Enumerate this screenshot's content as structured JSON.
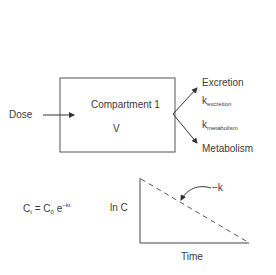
{
  "compartment": {
    "title": "Compartment 1",
    "volume": "V"
  },
  "input": {
    "label": "Dose"
  },
  "outputs": {
    "top": "Excretion",
    "bottom": "Metabolism",
    "k1_base": "k",
    "k1_sub": "excretion",
    "k2_base": "k",
    "k2_sub": "metabolism"
  },
  "equation": {
    "lhs_base": "C",
    "lhs_sub": "t",
    "equals": "=",
    "c0_base": "C",
    "c0_sub": "0",
    "exp_base": "e",
    "exp_sup": "−kt"
  },
  "graph": {
    "y_label": "ln C",
    "x_label": "Time",
    "slope_label": "−k"
  },
  "colors": {
    "line": "#333333",
    "text": "#3a3a3a"
  }
}
